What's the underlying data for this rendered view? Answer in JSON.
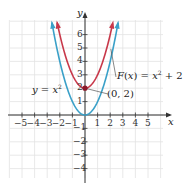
{
  "chart_data": {
    "type": "line",
    "title": "",
    "xlabel": "x",
    "ylabel": "y",
    "xlim": [
      -5.8,
      6.2
    ],
    "ylim": [
      -4.8,
      7.2
    ],
    "grid": true,
    "x_ticks": [
      "-5",
      "-4",
      "-3",
      "-2",
      "-1",
      "1",
      "2",
      "3",
      "4",
      "5"
    ],
    "y_ticks": [
      "6",
      "5",
      "4",
      "3",
      "2",
      "1",
      "-1",
      "-2",
      "-3",
      "-4"
    ],
    "series": [
      {
        "name": "y = x²",
        "label": "y = x",
        "label_sup": "2",
        "color": "#3aa0c8",
        "formula": "x^2",
        "x": [
          -2.6,
          -2,
          -1,
          0,
          1,
          2,
          2.6
        ],
        "y": [
          6.76,
          4,
          1,
          0,
          1,
          4,
          6.76
        ]
      },
      {
        "name": "F(x) = x² + 2",
        "label": "F(x) = x",
        "label_sup": "2",
        "label_tail": " + 2",
        "color": "#c8384a",
        "formula": "x^2+2",
        "x": [
          -2.2,
          -2,
          -1,
          0,
          1,
          2,
          2.2
        ],
        "y": [
          6.84,
          6,
          3,
          2,
          3,
          6,
          6.84
        ]
      }
    ],
    "annotations": [
      {
        "text": "(0, 2)",
        "point": [
          0,
          2
        ],
        "color": "#8b1a2a"
      }
    ]
  }
}
